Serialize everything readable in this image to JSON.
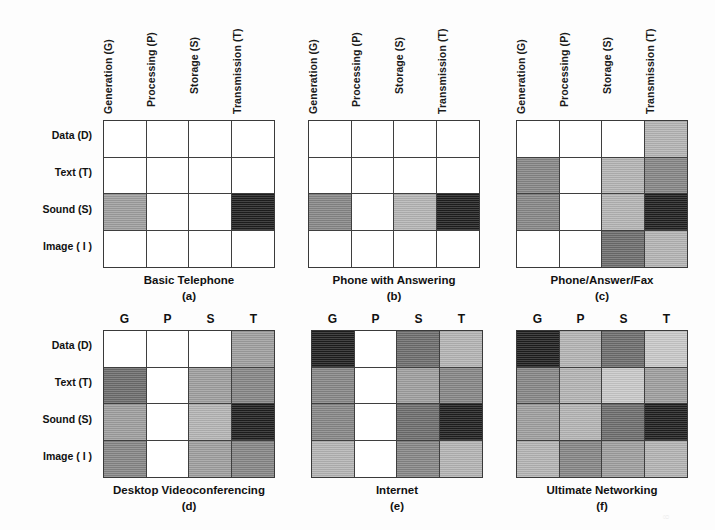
{
  "figure": {
    "column_headers_long": [
      "Generation (G)",
      "Processing (P)",
      "Storage (S)",
      "Transmission (T)"
    ],
    "column_headers_short": [
      "G",
      "P",
      "S",
      "T"
    ],
    "row_labels": [
      "Data (D)",
      "Text (T)",
      "Sound (S)",
      "Image ( I )"
    ],
    "page_mark": "8"
  },
  "shades": {
    "empty": "#ffffff",
    "very_light": "#e6e6e6",
    "light": "#bdbdbd",
    "medium_light": "#a8a8a8",
    "medium": "#8e8e8e",
    "medium_dark": "#6f6f6f",
    "dark": "#545454",
    "very_dark": "#2a2a2a",
    "black": "#1a1a1a"
  },
  "chart_data": {
    "type": "heatmap",
    "title": "",
    "xlabel": "",
    "ylabel": "",
    "grid": true,
    "legend": "none",
    "categories_x": [
      "Generation (G)",
      "Processing (P)",
      "Storage (S)",
      "Transmission (T)"
    ],
    "categories_y": [
      "Data (D)",
      "Text (T)",
      "Sound (S)",
      "Image ( I )"
    ],
    "scale_note": "Gray intensity encodes degree of capability: white = none, darker = greater",
    "panels": [
      {
        "id": "a",
        "label": "(a)",
        "title": "Basic Telephone",
        "header_style": "long",
        "values": [
          [
            0,
            0,
            0,
            0
          ],
          [
            0,
            0,
            0,
            0
          ],
          [
            5,
            0,
            0,
            9
          ],
          [
            0,
            0,
            0,
            0
          ]
        ]
      },
      {
        "id": "b",
        "label": "(b)",
        "title": "Phone with Answering",
        "header_style": "long",
        "values": [
          [
            0,
            0,
            0,
            0
          ],
          [
            0,
            0,
            0,
            0
          ],
          [
            6,
            0,
            4,
            9
          ],
          [
            0,
            0,
            0,
            0
          ]
        ]
      },
      {
        "id": "c",
        "label": "(c)",
        "title": "Phone/Answer/Fax",
        "header_style": "long",
        "values": [
          [
            0,
            0,
            0,
            4
          ],
          [
            6,
            0,
            4,
            6
          ],
          [
            6,
            0,
            4,
            9
          ],
          [
            0,
            0,
            7,
            4
          ]
        ]
      },
      {
        "id": "d",
        "label": "(d)",
        "title": "Desktop  Videoconferencing",
        "header_style": "short",
        "values": [
          [
            0,
            0,
            0,
            5
          ],
          [
            7,
            0,
            5,
            6
          ],
          [
            5,
            0,
            4,
            9
          ],
          [
            6,
            0,
            5,
            6
          ]
        ]
      },
      {
        "id": "e",
        "label": "(e)",
        "title": "Internet",
        "header_style": "short",
        "values": [
          [
            9,
            0,
            7,
            4
          ],
          [
            6,
            0,
            5,
            6
          ],
          [
            6,
            0,
            7,
            9
          ],
          [
            4,
            0,
            6,
            4
          ]
        ]
      },
      {
        "id": "f",
        "label": "(f)",
        "title": "Ultimate Networking",
        "header_style": "short",
        "values": [
          [
            9,
            4,
            7,
            3
          ],
          [
            6,
            4,
            3,
            5
          ],
          [
            5,
            4,
            7,
            9
          ],
          [
            4,
            6,
            5,
            4
          ]
        ]
      }
    ]
  }
}
